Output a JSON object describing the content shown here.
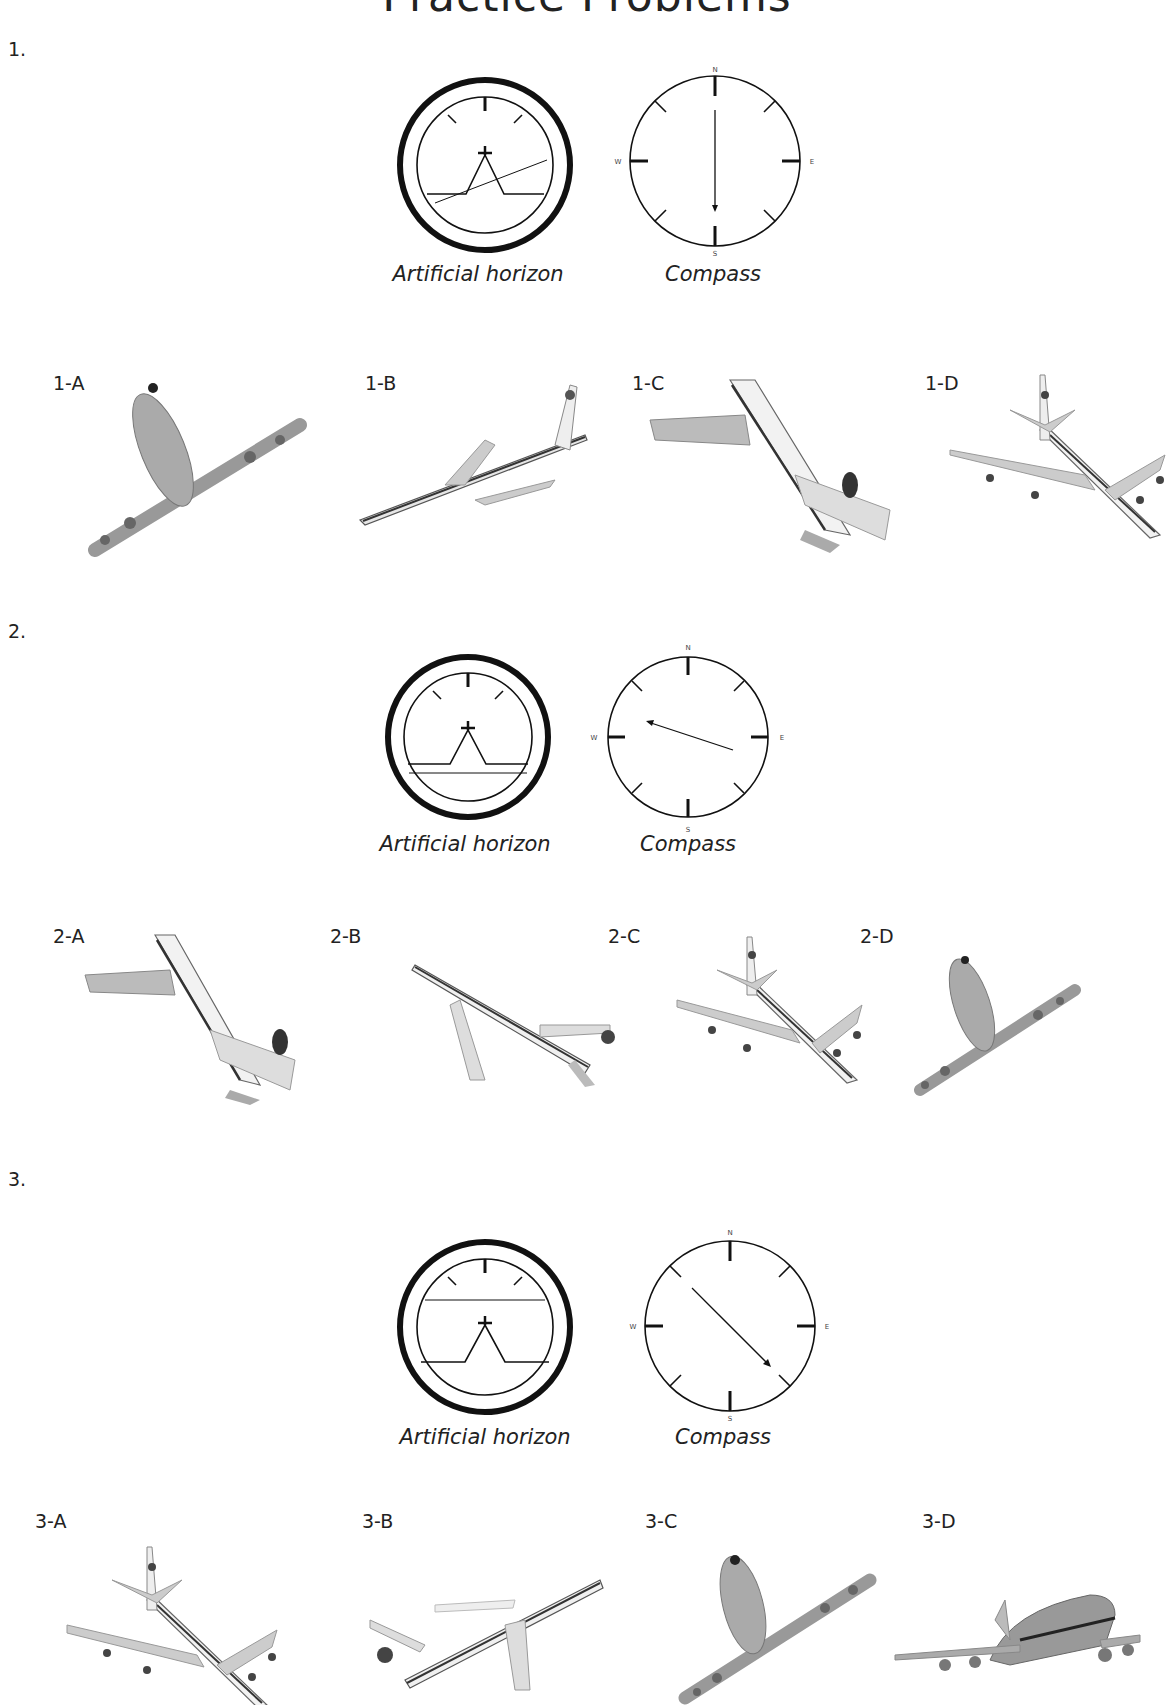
{
  "title": "Practice Problems",
  "problems": [
    {
      "number": "1.",
      "horizon_caption": "Artificial horizon",
      "compass_caption": "Compass",
      "compass_labels": {
        "n": "N",
        "e": "E",
        "s": "S",
        "w": "W"
      },
      "horizon_state": "banked, horizon line tilted up to the right",
      "heading": "S",
      "options": [
        {
          "label": "1-A",
          "view": "underside, nose up, banked"
        },
        {
          "label": "1-B",
          "view": "side view, climbing right"
        },
        {
          "label": "1-C",
          "view": "rear view, diving left"
        },
        {
          "label": "1-D",
          "view": "top view, heading down-right"
        }
      ]
    },
    {
      "number": "2.",
      "horizon_caption": "Artificial horizon",
      "compass_caption": "Compass",
      "compass_labels": {
        "n": "N",
        "e": "E",
        "s": "S",
        "w": "W"
      },
      "horizon_state": "level, horizon slightly below wings (nose up)",
      "heading": "WNW",
      "options": [
        {
          "label": "2-A",
          "view": "rear view, diving left"
        },
        {
          "label": "2-B",
          "view": "side view, descending right"
        },
        {
          "label": "2-C",
          "view": "top view, heading down-right"
        },
        {
          "label": "2-D",
          "view": "underside, nose up, banked"
        }
      ]
    },
    {
      "number": "3.",
      "horizon_caption": "Artificial horizon",
      "compass_caption": "Compass",
      "compass_labels": {
        "n": "N",
        "e": "E",
        "s": "S",
        "w": "W"
      },
      "horizon_state": "level, horizon above wings (nose down)",
      "heading": "SE",
      "options": [
        {
          "label": "3-A",
          "view": "top view, heading down-right"
        },
        {
          "label": "3-B",
          "view": "side view, climbing right"
        },
        {
          "label": "3-C",
          "view": "underside, nose up, banked"
        },
        {
          "label": "3-D",
          "view": "front view, level flight"
        }
      ]
    }
  ]
}
